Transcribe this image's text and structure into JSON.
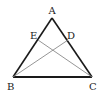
{
  "diagram": {
    "type": "triangle-geometry",
    "colors": {
      "edge": "#1a1a1a",
      "cevian": "#8a8a8a",
      "label": "#222222"
    },
    "points": {
      "A": {
        "label": "A",
        "x": 52,
        "y": 18
      },
      "B": {
        "label": "B",
        "x": 13,
        "y": 77
      },
      "C": {
        "label": "C",
        "x": 92,
        "y": 77
      },
      "D": {
        "label": "D",
        "x": 68,
        "y": 40
      },
      "E": {
        "label": "E",
        "x": 38,
        "y": 40
      }
    },
    "segments": [
      "AB",
      "AC",
      "BC",
      "BD",
      "CE"
    ]
  }
}
